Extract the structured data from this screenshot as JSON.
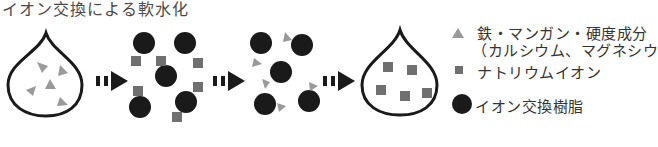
{
  "title": "イオン交換による軟水化",
  "legend": {
    "hardness": {
      "line1": "鉄・マンガン・硬度成分",
      "line2": "（カルシウム、マグネシウ",
      "icon": "gray-triangle"
    },
    "sodium": {
      "label": "ナトリウムイオン",
      "icon": "gray-square"
    },
    "resin": {
      "label": "イオン交換樹脂",
      "icon": "black-circle"
    }
  },
  "colors": {
    "hardness": "#9a9a9a",
    "sodium": "#6f6f6f",
    "resin": "#1a1a1a",
    "outline": "#1a1a1a"
  },
  "stages": [
    "hard-water-drop",
    "resin-with-sodium",
    "resin-with-hardness",
    "soft-water-drop"
  ]
}
